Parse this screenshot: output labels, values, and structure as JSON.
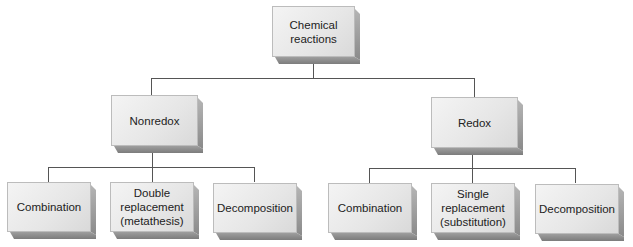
{
  "diagram": {
    "root": {
      "label": "Chemical\nreactions"
    },
    "branches": [
      {
        "label": "Nonredox",
        "children": [
          {
            "label": "Combination"
          },
          {
            "label": "Double\nreplacement\n(metathesis)"
          },
          {
            "label": "Decomposition"
          }
        ]
      },
      {
        "label": "Redox",
        "children": [
          {
            "label": "Combination"
          },
          {
            "label": "Single\nreplacement\n(substitution)"
          },
          {
            "label": "Decomposition"
          }
        ]
      }
    ],
    "colors": {
      "box_face": "#e8e8e8",
      "box_side": "#8a8a8a",
      "connector": "#555555"
    }
  }
}
